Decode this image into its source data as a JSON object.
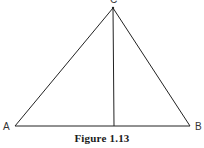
{
  "figure": {
    "caption": "Figure 1.13",
    "line_color": "#222222",
    "vertices": [
      {
        "label": "A",
        "x": 15,
        "y": 126,
        "label_x": 3,
        "label_y": 130
      },
      {
        "label": "B",
        "x": 190,
        "y": 126,
        "label_x": 195,
        "label_y": 130
      },
      {
        "label": "C",
        "x": 113,
        "y": 8,
        "label_x": 110,
        "label_y": 3
      }
    ],
    "altitude": {
      "from": "C",
      "foot_x": 114,
      "foot_y": 126
    },
    "labels": {
      "a": "A",
      "b": "B",
      "c": "C"
    }
  }
}
